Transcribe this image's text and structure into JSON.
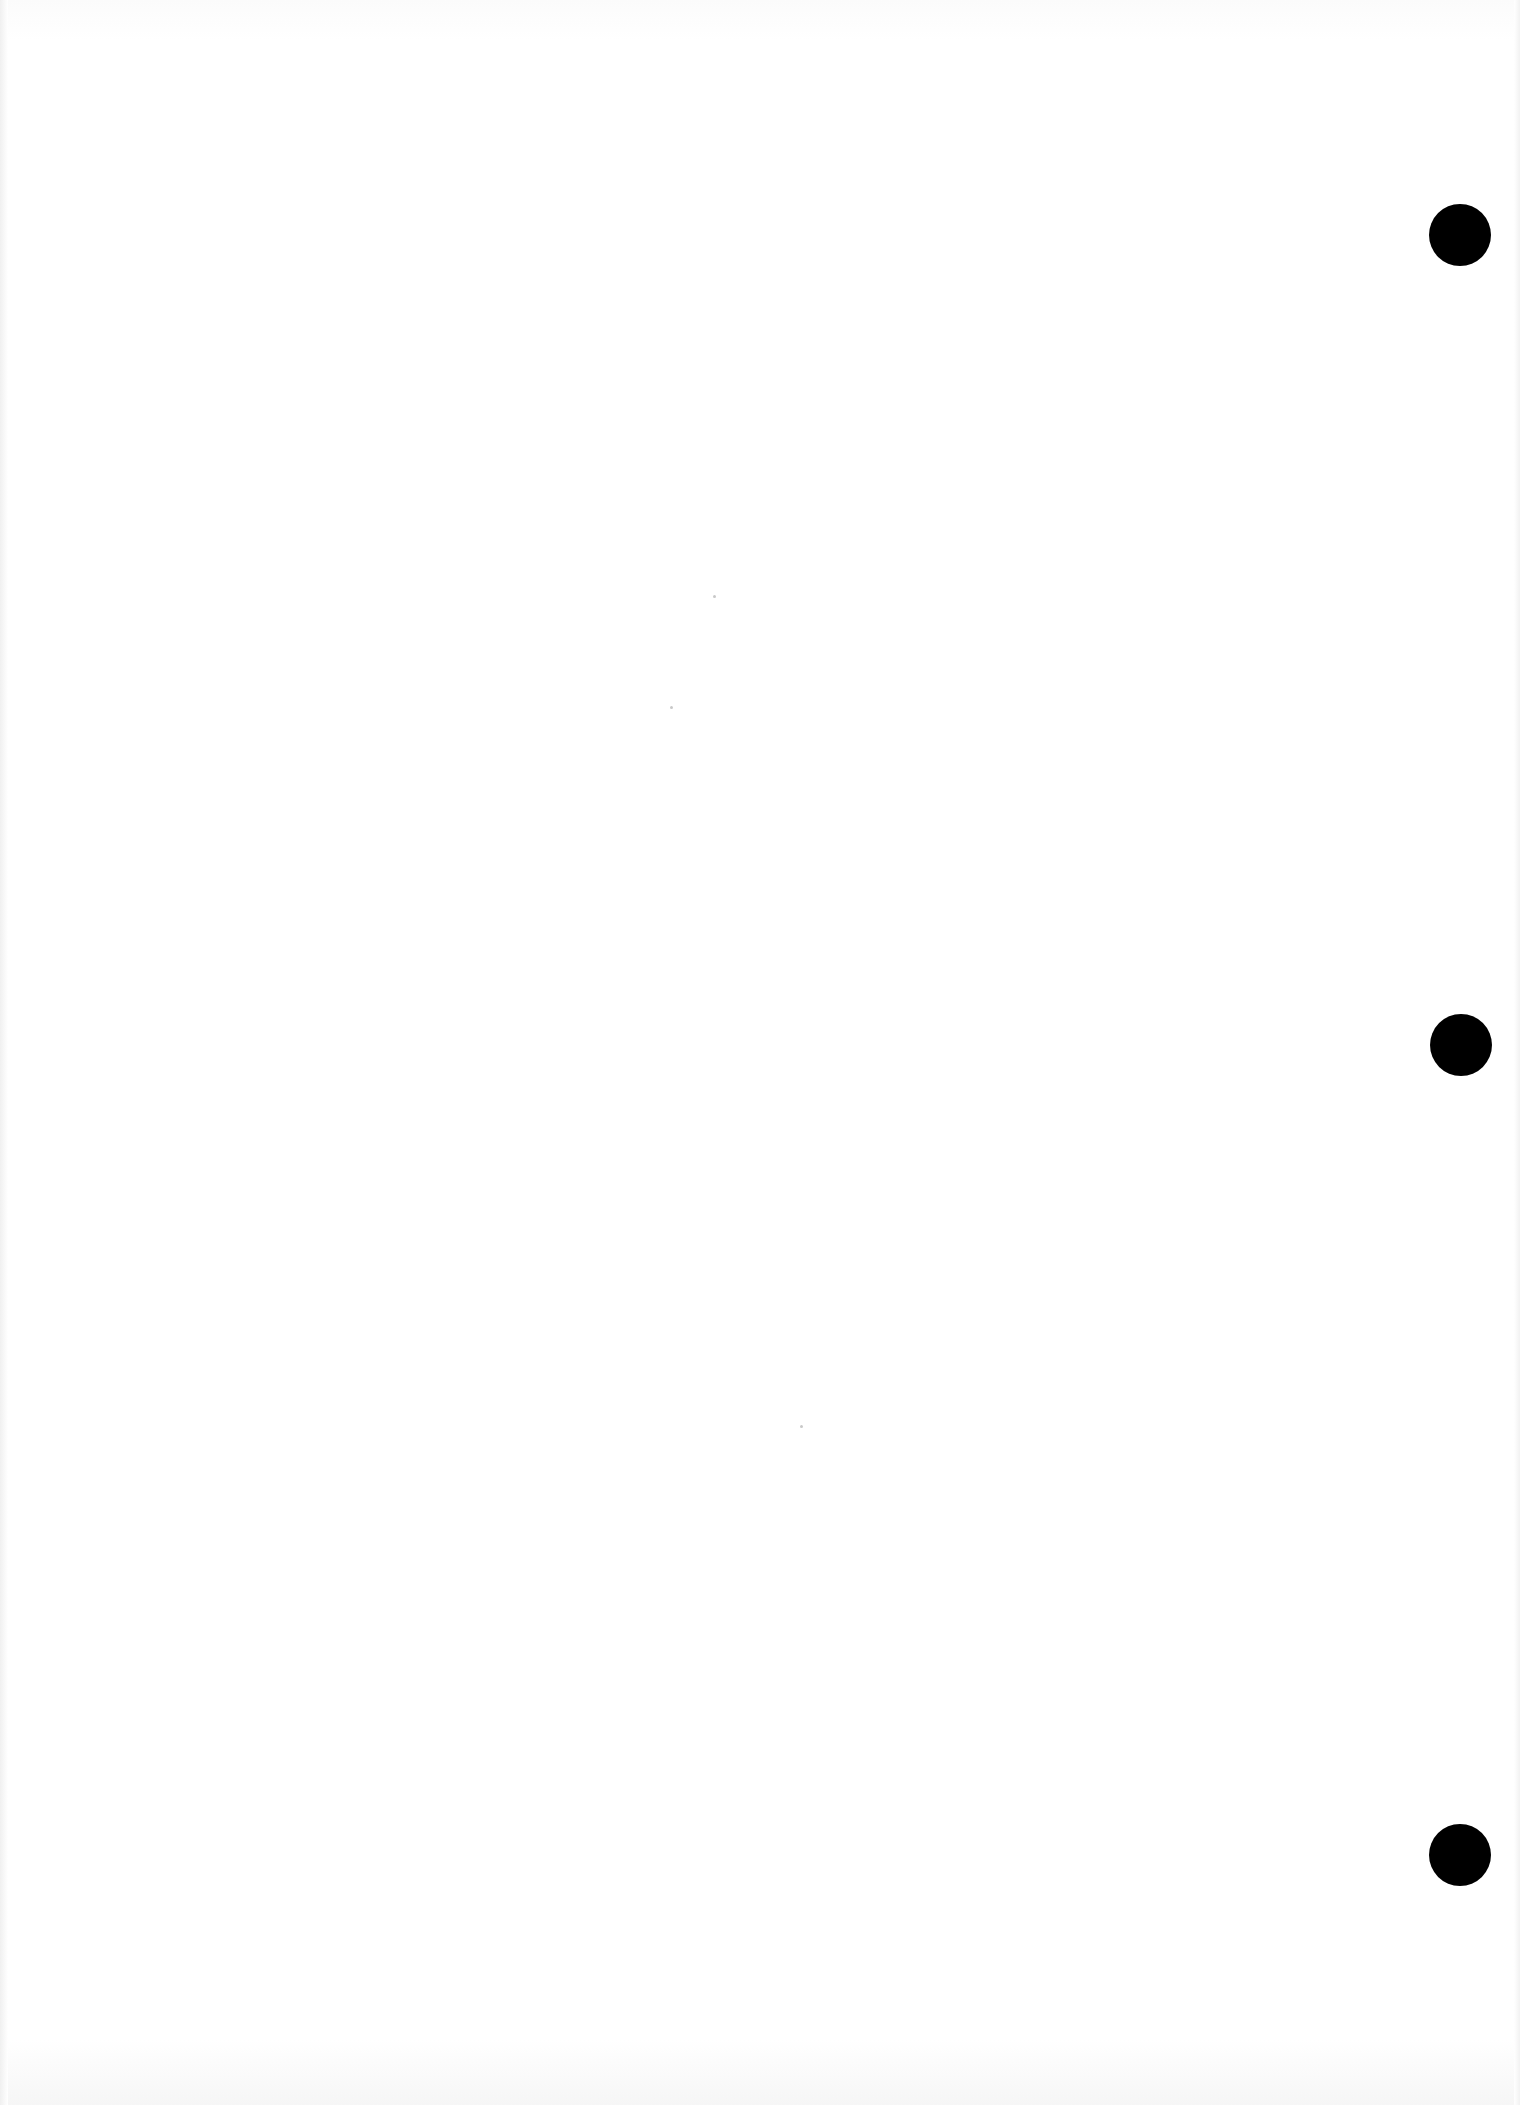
{
  "document": {
    "type": "blank scanned page",
    "text": "",
    "background_color": "#ffffff"
  },
  "punch_holes": [
    {
      "name": "top",
      "x": 1460,
      "y": 235,
      "diameter": 62,
      "color": "#000000"
    },
    {
      "name": "middle",
      "x": 1460,
      "y": 1045,
      "diameter": 62,
      "color": "#000000"
    },
    {
      "name": "bottom",
      "x": 1460,
      "y": 1855,
      "diameter": 62,
      "color": "#000000"
    }
  ]
}
